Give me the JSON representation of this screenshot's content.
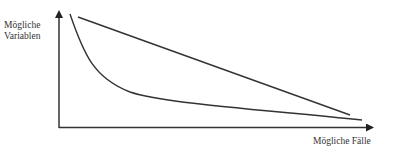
{
  "diagram": {
    "y_axis_label_line1": "Mögliche",
    "y_axis_label_line2": "Variablen",
    "x_axis_label": "Mögliche Fälle",
    "stroke_color": "#333333",
    "series": [
      {
        "name": "straight-line",
        "shape": "linear",
        "from": [
          78,
          17
        ],
        "to": [
          350,
          115
        ]
      },
      {
        "name": "decay-curve",
        "shape": "convex",
        "from": [
          70,
          14
        ],
        "to": [
          362,
          120
        ]
      }
    ]
  }
}
